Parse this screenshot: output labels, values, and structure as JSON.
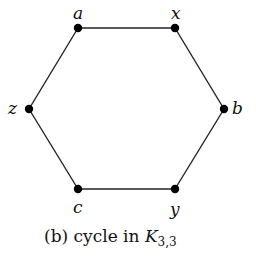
{
  "figure": {
    "caption_prefix": "(b) cycle in ",
    "caption_K": "K",
    "caption_sub": "3,3",
    "vertices": [
      {
        "id": "a",
        "label": "a"
      },
      {
        "id": "x",
        "label": "x"
      },
      {
        "id": "b",
        "label": "b"
      },
      {
        "id": "y",
        "label": "y"
      },
      {
        "id": "c",
        "label": "c"
      },
      {
        "id": "z",
        "label": "z"
      }
    ],
    "edges": [
      [
        "a",
        "x"
      ],
      [
        "x",
        "b"
      ],
      [
        "b",
        "y"
      ],
      [
        "y",
        "c"
      ],
      [
        "c",
        "z"
      ],
      [
        "z",
        "a"
      ]
    ]
  }
}
